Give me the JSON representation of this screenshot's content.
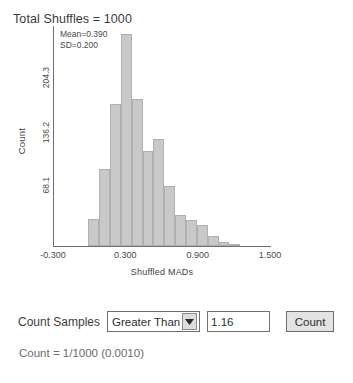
{
  "chart_data": {
    "type": "bar",
    "title": "Total Shuffles = 1000",
    "xlabel": "Shuffled MADs",
    "ylabel": "Count",
    "xlim": [
      -0.3,
      1.5
    ],
    "ylim": [
      0,
      272.4
    ],
    "grid": false,
    "legend": null,
    "xticks": [
      "-0.300",
      "0.300",
      "0.900",
      "1.500"
    ],
    "xtick_values": [
      -0.3,
      0.3,
      0.9,
      1.5
    ],
    "yticks": [
      "68.1",
      "136.2",
      "204.3"
    ],
    "ytick_values": [
      68.1,
      136.2,
      204.3
    ],
    "annotations": [
      "Mean=0.390",
      "SD=0.200"
    ],
    "statistics": {
      "mean": 0.39,
      "sd": 0.2,
      "total_shuffles": 1000
    },
    "bin_width": 0.09,
    "categories": [
      0.03,
      0.12,
      0.21,
      0.3,
      0.39,
      0.48,
      0.57,
      0.66,
      0.75,
      0.84,
      0.93,
      1.02,
      1.11,
      1.2
    ],
    "values": [
      34,
      95,
      176,
      262,
      182,
      118,
      133,
      74,
      39,
      32,
      26,
      12,
      5,
      3
    ]
  },
  "controls": {
    "count_samples_label": "Count Samples",
    "comparison_selected": "Greater Than",
    "comparison_options": [
      "Greater Than",
      "Less Than"
    ],
    "threshold_value": "1.16",
    "threshold_placeholder": "",
    "count_button_label": "Count",
    "result_text": "Count = 1/1000 (0.0010)"
  },
  "colors": {
    "bar_fill": "#c9c9c9",
    "bar_stroke": "#b0b0b0",
    "axis": "#6e6e6e",
    "text": "#3d3d3d",
    "muted_text": "#6a6a6a"
  }
}
